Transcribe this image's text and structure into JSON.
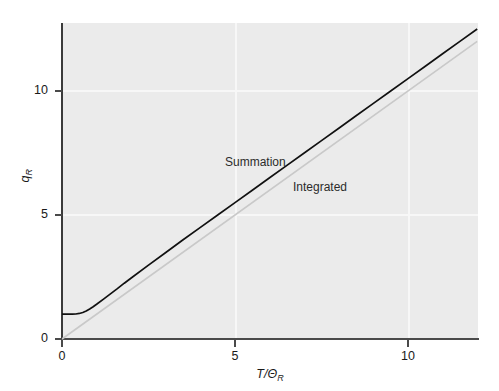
{
  "chart_data": {
    "type": "line",
    "title": "",
    "xlabel": "T/ΘR",
    "xlabel_main": "T/Θ",
    "xlabel_sub": "R",
    "ylabel": "qR",
    "ylabel_main": "q",
    "ylabel_sub": "R",
    "xlim": [
      0,
      12
    ],
    "ylim": [
      0,
      12.8
    ],
    "xticks": [
      0,
      5,
      10
    ],
    "xtick_labels": [
      "0",
      "5",
      "10"
    ],
    "yticks": [
      0,
      5,
      10
    ],
    "ytick_labels": [
      "0",
      "5",
      "10"
    ],
    "grid": true,
    "grid_color": "#f7f7f7",
    "panel_background": "#ebebeb",
    "legend_position": "inline-annotations",
    "series": [
      {
        "name": "Summation",
        "color": "#111111",
        "linewidth": 1.7,
        "label_text": "Summation",
        "x": [
          0.0,
          0.1,
          0.2,
          0.3,
          0.4,
          0.5,
          0.6,
          0.7,
          0.8,
          0.9,
          1.0,
          1.2,
          1.4,
          1.6,
          1.8,
          2.0,
          2.5,
          3.0,
          3.5,
          4.0,
          4.5,
          5.0,
          5.5,
          6.0,
          6.5,
          7.0,
          7.5,
          8.0,
          8.5,
          9.0,
          9.5,
          10.0,
          10.5,
          11.0,
          11.5,
          12.0
        ],
        "y": [
          1.0,
          1.0,
          1.0,
          1.001,
          1.008,
          1.03,
          1.07,
          1.13,
          1.21,
          1.3,
          1.4,
          1.61,
          1.82,
          2.03,
          2.25,
          2.46,
          2.98,
          3.49,
          4.0,
          4.5,
          5.0,
          5.5,
          6.0,
          6.5,
          7.0,
          7.5,
          8.0,
          8.5,
          9.0,
          9.5,
          10.0,
          10.5,
          11.0,
          11.5,
          12.0,
          12.5
        ]
      },
      {
        "name": "Integrated",
        "color": "#c9c9c9",
        "linewidth": 1.6,
        "label_text": "Integrated",
        "x": [
          0,
          12
        ],
        "y": [
          0,
          12.0
        ]
      }
    ]
  },
  "axes": {
    "y_ticks": [
      {
        "value": 10,
        "label": "10",
        "px": 91
      },
      {
        "value": 5,
        "label": "5",
        "px": 215
      },
      {
        "value": 0,
        "label": "0",
        "px": 339
      }
    ],
    "x_ticks": [
      {
        "value": 0,
        "label": "0",
        "px": 62
      },
      {
        "value": 5,
        "label": "5",
        "px": 235
      },
      {
        "value": 10,
        "label": "10",
        "px": 408
      }
    ]
  },
  "annotations": {
    "summation": "Summation",
    "integrated": "Integrated"
  }
}
